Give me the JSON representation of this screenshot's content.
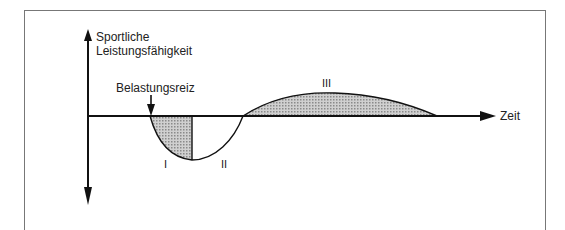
{
  "diagram": {
    "y_axis_label_line1": "Sportliche",
    "y_axis_label_line2": "Leistungsfähigkeit",
    "x_axis_label": "Zeit",
    "stimulus_label": "Belastungsreiz",
    "phases": [
      {
        "id": "I",
        "label": "I",
        "description": "shaded fatigue phase"
      },
      {
        "id": "II",
        "label": "II",
        "description": "recovery phase"
      },
      {
        "id": "III",
        "label": "III",
        "description": "shaded supercompensation phase"
      }
    ],
    "colors": {
      "line": "#111111",
      "shade": "#b9b9b9",
      "frame": "#777777"
    }
  }
}
